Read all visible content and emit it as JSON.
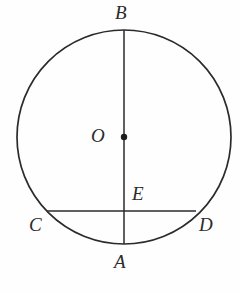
{
  "figure": {
    "kind": "circle-geometry-diagram",
    "canvas": {
      "width": 240,
      "height": 294,
      "background": "#fefefe"
    },
    "stroke_color": "#2b2b2b",
    "label_color": "#2b2b2b",
    "circle": {
      "name": "main-circle",
      "center_x": 124,
      "center_y": 137,
      "radius": 107,
      "stroke_width": 1.7,
      "fill": "none"
    },
    "center_point": {
      "name": "center-point-O",
      "x": 124,
      "y": 137,
      "radius": 3.2
    },
    "segments": [
      {
        "name": "diameter-AB",
        "from_label": "B",
        "to_label": "A",
        "x1": 124,
        "y1": 30,
        "x2": 124,
        "y2": 244,
        "stroke_width": 1.5
      },
      {
        "name": "chord-CD",
        "from_label": "C",
        "to_label": "D",
        "x1": 47,
        "y1": 211,
        "x2": 196,
        "y2": 211,
        "stroke_width": 1.5
      }
    ],
    "labels": [
      {
        "id": "B",
        "text": "B",
        "x": 115,
        "y": 3,
        "describes": "top endpoint of vertical diameter"
      },
      {
        "id": "O",
        "text": "O",
        "x": 91,
        "y": 126,
        "describes": "center of the circle"
      },
      {
        "id": "E",
        "text": "E",
        "x": 132,
        "y": 184,
        "describes": "intersection of diameter AB and chord CD"
      },
      {
        "id": "C",
        "text": "C",
        "x": 29,
        "y": 215,
        "describes": "left endpoint of chord"
      },
      {
        "id": "D",
        "text": "D",
        "x": 199,
        "y": 215,
        "describes": "right endpoint of chord"
      },
      {
        "id": "A",
        "text": "A",
        "x": 114,
        "y": 252,
        "describes": "bottom endpoint of vertical diameter"
      }
    ]
  }
}
